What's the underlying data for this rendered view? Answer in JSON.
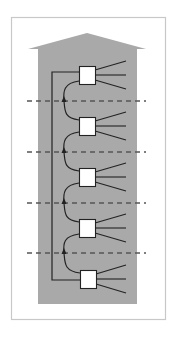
{
  "diagram": {
    "type": "building-riser-diagram",
    "colors": {
      "background": "#ffffff",
      "frame": "#c8c8c8",
      "building_fill": "#a9a9a9",
      "line": "#222222",
      "dashed": "#555555",
      "box_fill": "#ffffff",
      "box_stroke": "#222222"
    },
    "frame": {
      "x": 11,
      "y": 17,
      "width": 154,
      "height": 302
    },
    "building": {
      "roof_peak": [
        87,
        33
      ],
      "left_eave": [
        28,
        49
      ],
      "right_eave": [
        146,
        49
      ],
      "body": {
        "x": 38,
        "y": 49,
        "width": 99,
        "height": 255
      }
    },
    "riser": {
      "x": 52,
      "top_y": 72,
      "bottom_y": 280
    },
    "floor_separators_y": [
      101,
      152,
      203,
      253
    ],
    "separator_x": [
      27,
      146
    ],
    "nodes": [
      {
        "label": "",
        "x": 79,
        "y": 66,
        "w": 16,
        "h": 18
      },
      {
        "label": "",
        "x": 79,
        "y": 117,
        "w": 16,
        "h": 18
      },
      {
        "label": "",
        "x": 79,
        "y": 168,
        "w": 16,
        "h": 18
      },
      {
        "label": "",
        "x": 79,
        "y": 219,
        "w": 16,
        "h": 18
      },
      {
        "label": "",
        "x": 80,
        "y": 270,
        "w": 16,
        "h": 18
      }
    ],
    "fan_out_lines_per_node": 3,
    "fan_end_x": 126,
    "arrows": [
      {
        "x": 64,
        "y": 101,
        "direction": "up"
      },
      {
        "x": 64,
        "y": 152,
        "direction": "up"
      },
      {
        "x": 64,
        "y": 203,
        "direction": "up"
      },
      {
        "x": 64,
        "y": 253,
        "direction": "up"
      }
    ]
  }
}
